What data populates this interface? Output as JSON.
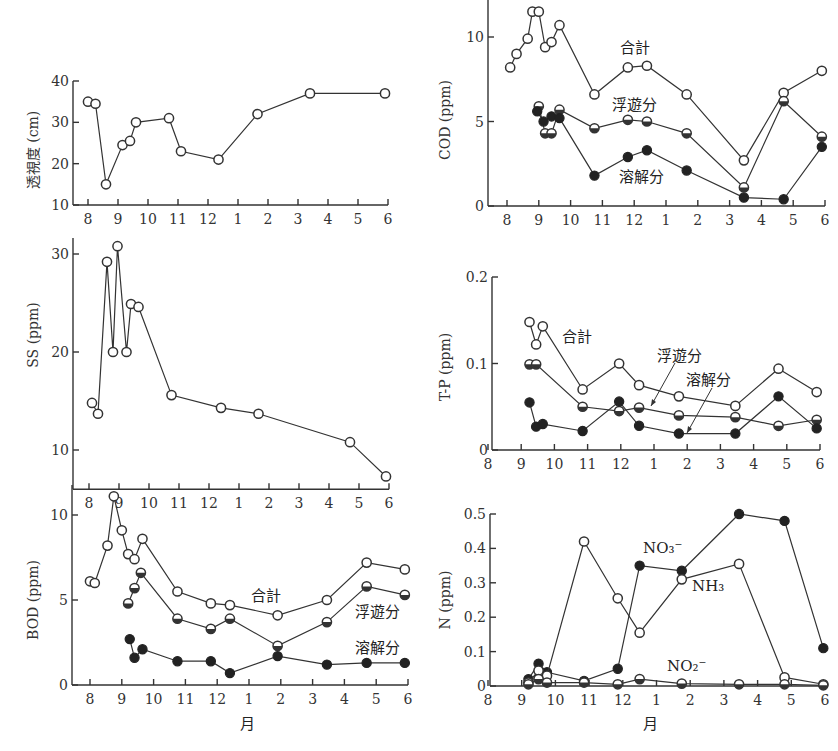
{
  "figure": {
    "xlabel": "月",
    "month_ticks": [
      "8",
      "9",
      "10",
      "11",
      "12",
      "1",
      "2",
      "3",
      "4",
      "5",
      "6"
    ]
  },
  "chart_data": [
    {
      "id": "transparency",
      "type": "line",
      "title": "",
      "ylabel": "透視度 (cm)",
      "xlabel": "",
      "ylim": [
        10,
        40
      ],
      "yticks": [
        "10",
        "20",
        "30",
        "40"
      ],
      "xticks": [
        "8",
        "9",
        "10",
        "11",
        "12",
        "1",
        "2",
        "3",
        "4",
        "5",
        "6"
      ],
      "series": [
        {
          "name": "透視度",
          "marker": "open",
          "x": [
            8.0,
            8.25,
            8.6,
            9.15,
            9.4,
            9.6,
            10.7,
            11.1,
            12.35,
            13.65,
            15.4,
            17.9
          ],
          "values": [
            35,
            34.5,
            15,
            24.5,
            25.5,
            30,
            31,
            23,
            21,
            32,
            37,
            37
          ]
        }
      ]
    },
    {
      "id": "cod",
      "type": "line",
      "ylabel": "COD (ppm)",
      "ylim": [
        0,
        12
      ],
      "yticks": [
        "0",
        "5",
        "10"
      ],
      "xticks": [
        "8",
        "9",
        "10",
        "11",
        "12",
        "1",
        "2",
        "3",
        "4",
        "5",
        "6"
      ],
      "series": [
        {
          "name": "合計",
          "marker": "open",
          "x": [
            8.1,
            8.3,
            8.65,
            8.8,
            9.0,
            9.2,
            9.4,
            9.65,
            10.75,
            11.8,
            12.4,
            13.65,
            15.45,
            16.7,
            17.9
          ],
          "values": [
            8.2,
            9.0,
            9.9,
            11.5,
            11.5,
            9.4,
            9.7,
            10.7,
            6.6,
            8.2,
            8.3,
            6.6,
            2.7,
            6.7,
            8.0
          ]
        },
        {
          "name": "浮遊分",
          "marker": "half",
          "x": [
            9.0,
            9.2,
            9.4,
            9.65,
            10.75,
            11.8,
            12.4,
            13.65,
            15.45,
            16.7,
            17.9
          ],
          "values": [
            5.9,
            4.3,
            4.3,
            5.7,
            4.6,
            5.1,
            5.0,
            4.3,
            1.1,
            6.2,
            4.1
          ]
        },
        {
          "name": "溶解分",
          "marker": "filled",
          "x": [
            8.95,
            9.15,
            9.4,
            9.65,
            10.75,
            11.8,
            12.4,
            13.65,
            15.45,
            16.7,
            17.9
          ],
          "values": [
            5.6,
            5.0,
            5.3,
            5.2,
            1.8,
            2.9,
            3.3,
            2.1,
            0.5,
            0.4,
            3.5
          ]
        }
      ]
    },
    {
      "id": "ss",
      "type": "line",
      "ylabel": "SS (ppm)",
      "ylim": [
        6,
        31
      ],
      "yticks": [
        "10",
        "20",
        "30"
      ],
      "xticks": [
        "8",
        "9",
        "10",
        "11",
        "12",
        "1",
        "2",
        "3",
        "4",
        "5",
        "6"
      ],
      "series": [
        {
          "name": "SS",
          "marker": "open",
          "x": [
            8.1,
            8.3,
            8.6,
            8.8,
            8.95,
            9.25,
            9.4,
            9.65,
            10.75,
            12.4,
            13.65,
            16.7,
            17.9
          ],
          "values": [
            14.8,
            13.7,
            29.2,
            20,
            30.8,
            20,
            24.9,
            24.6,
            15.6,
            14.3,
            13.7,
            10.8,
            7.3
          ]
        }
      ]
    },
    {
      "id": "tp",
      "type": "line",
      "ylabel": "T-P (ppm)",
      "ylim": [
        0,
        0.2
      ],
      "yticks": [
        "0",
        "0.1",
        "0.2"
      ],
      "xticks": [
        "8",
        "9",
        "10",
        "11",
        "12",
        "1",
        "2",
        "3",
        "4",
        "5",
        "6"
      ],
      "series": [
        {
          "name": "合計",
          "marker": "open",
          "x": [
            9.25,
            9.45,
            9.65,
            10.85,
            11.95,
            12.55,
            13.75,
            15.45,
            16.75,
            17.9
          ],
          "values": [
            0.148,
            0.122,
            0.143,
            0.07,
            0.1,
            0.075,
            0.062,
            0.051,
            0.094,
            0.067
          ]
        },
        {
          "name": "浮遊分",
          "marker": "half",
          "x": [
            9.25,
            9.45,
            10.85,
            11.95,
            12.55,
            13.75,
            15.45,
            16.75,
            17.9
          ],
          "values": [
            0.099,
            0.099,
            0.05,
            0.045,
            0.049,
            0.04,
            0.038,
            0.028,
            0.035
          ]
        },
        {
          "name": "溶解分",
          "marker": "filled",
          "x": [
            9.25,
            9.45,
            9.65,
            10.85,
            11.95,
            12.55,
            13.75,
            15.45,
            16.75,
            17.9
          ],
          "values": [
            0.055,
            0.027,
            0.03,
            0.022,
            0.056,
            0.028,
            0.019,
            0.019,
            0.062,
            0.025
          ]
        }
      ]
    },
    {
      "id": "bod",
      "type": "line",
      "ylabel": "BOD (ppm)",
      "ylim": [
        0,
        12
      ],
      "yticks": [
        "0",
        "5",
        "10"
      ],
      "xticks": [
        "8",
        "9",
        "10",
        "11",
        "12",
        "1",
        "2",
        "3",
        "4",
        "5",
        "6"
      ],
      "series": [
        {
          "name": "合計",
          "marker": "open",
          "x": [
            8.0,
            8.15,
            8.55,
            8.75,
            9.0,
            9.2,
            9.4,
            9.65,
            10.75,
            11.8,
            12.4,
            13.9,
            15.45,
            16.7,
            17.9
          ],
          "values": [
            6.1,
            6.0,
            8.2,
            11.1,
            9.1,
            7.7,
            7.4,
            8.6,
            5.5,
            4.8,
            4.7,
            4.1,
            5.0,
            7.2,
            6.8
          ]
        },
        {
          "name": "浮遊分",
          "marker": "half",
          "x": [
            9.2,
            9.4,
            9.6,
            10.75,
            11.8,
            12.4,
            13.9,
            15.45,
            16.7,
            17.9
          ],
          "values": [
            4.8,
            5.7,
            6.6,
            3.9,
            3.3,
            3.9,
            2.3,
            3.7,
            5.8,
            5.3
          ]
        },
        {
          "name": "溶解分",
          "marker": "filled",
          "x": [
            9.25,
            9.4,
            9.65,
            10.75,
            11.8,
            12.4,
            13.9,
            15.45,
            16.7,
            17.9
          ],
          "values": [
            2.7,
            1.6,
            2.1,
            1.4,
            1.4,
            0.7,
            1.7,
            1.2,
            1.3,
            1.3
          ]
        }
      ]
    },
    {
      "id": "nitrogen",
      "type": "line",
      "ylabel": "N (ppm)",
      "xlabel": "月",
      "ylim": [
        0,
        0.5
      ],
      "yticks": [
        "0",
        "0.1",
        "0.2",
        "0.3",
        "0.4",
        "0.5"
      ],
      "xticks": [
        "8",
        "9",
        "10",
        "11",
        "12",
        "1",
        "2",
        "3",
        "4",
        "5",
        "6"
      ],
      "series": [
        {
          "name": "NO3-",
          "marker": "filled",
          "x": [
            9.2,
            9.5,
            9.75,
            10.85,
            11.85,
            12.5,
            13.75,
            15.45,
            16.8,
            17.95
          ],
          "values": [
            0.02,
            0.065,
            0.04,
            0.015,
            0.05,
            0.35,
            0.335,
            0.5,
            0.48,
            0.11
          ]
        },
        {
          "name": "NH3",
          "marker": "open",
          "x": [
            9.2,
            9.5,
            9.75,
            10.85,
            11.85,
            12.5,
            13.75,
            15.45,
            16.8,
            17.95
          ],
          "values": [
            0.01,
            0.045,
            0.03,
            0.42,
            0.255,
            0.155,
            0.31,
            0.355,
            0.025,
            0.005
          ]
        },
        {
          "name": "NO2-",
          "marker": "half",
          "x": [
            9.2,
            9.5,
            9.75,
            10.85,
            11.85,
            12.5,
            13.75,
            15.45,
            16.8,
            17.95
          ],
          "values": [
            0.005,
            0.02,
            0.01,
            0.01,
            0.005,
            0.02,
            0.007,
            0.005,
            0.005,
            0.002
          ]
        }
      ]
    }
  ],
  "annotations": {
    "cod_total": "合計",
    "cod_suspended": "浮遊分",
    "cod_dissolved": "溶解分",
    "tp_total": "合計",
    "tp_suspended": "浮遊分",
    "tp_dissolved": "溶解分",
    "bod_total": "合計",
    "bod_suspended": "浮遊分",
    "bod_dissolved": "溶解分",
    "n_no3": "NO₃⁻",
    "n_nh3": "NH₃",
    "n_no2": "NO₂⁻"
  }
}
